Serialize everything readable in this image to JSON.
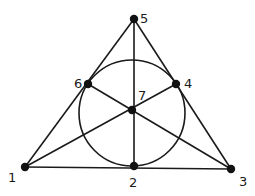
{
  "diagram": {
    "points": [
      {
        "id": "1",
        "label": "1"
      },
      {
        "id": "2",
        "label": "2"
      },
      {
        "id": "3",
        "label": "3"
      },
      {
        "id": "4",
        "label": "4"
      },
      {
        "id": "5",
        "label": "5"
      },
      {
        "id": "6",
        "label": "6"
      },
      {
        "id": "7",
        "label": "7"
      }
    ],
    "lines": [
      [
        "1",
        "2",
        "3"
      ],
      [
        "3",
        "4",
        "5"
      ],
      [
        "5",
        "6",
        "1"
      ],
      [
        "1",
        "7",
        "4"
      ],
      [
        "3",
        "7",
        "6"
      ],
      [
        "5",
        "7",
        "2"
      ],
      [
        "2",
        "4",
        "6"
      ]
    ],
    "circle_line": [
      "2",
      "4",
      "6"
    ],
    "colors": {
      "stroke": "#1a1a1a",
      "point": "#111111",
      "background": "#ffffff"
    }
  }
}
